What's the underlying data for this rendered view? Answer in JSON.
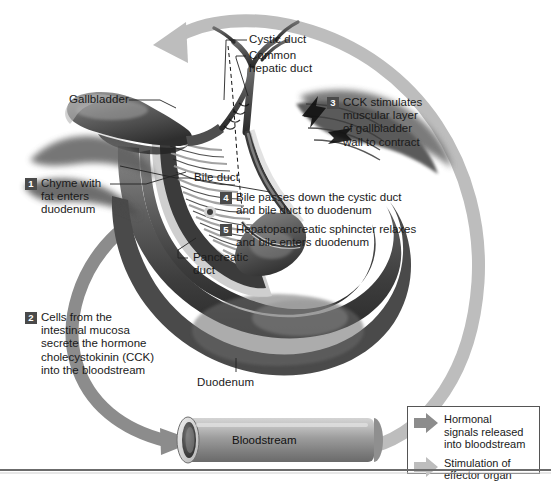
{
  "figure": {
    "background": "#ffffff",
    "width": 551,
    "height": 486
  },
  "colors": {
    "hormonal_arrow": "#8c8c8c",
    "stimulation_arrow": "#bdbdbd",
    "badge_background": "#4a4a4a",
    "badge_text": "#ffffff",
    "label_text": "#1a1a1a",
    "leader_line": "#222222",
    "legend_border": "#555555",
    "rule": "#6b6b6b"
  },
  "steps": [
    {
      "number": "1",
      "text": "Chyme with\nfat enters\nduodenum"
    },
    {
      "number": "2",
      "text": "Cells from the\nintestinal mucosa\nsecrete the hormone\ncholecystokinin (CCK)\ninto the bloodstream"
    },
    {
      "number": "3",
      "text": "CCK stimulates\nmuscular layer\nof gallbladder\nwall to contract"
    },
    {
      "number": "4",
      "text": "Bile passes down the cystic duct\nand bile duct to duodenum"
    },
    {
      "number": "5",
      "text": "Hepatopancreatic sphincter relaxes\nand bile enters duodenum"
    }
  ],
  "anatomy_labels": [
    {
      "name": "cystic-duct",
      "text": "Cystic duct"
    },
    {
      "name": "common-hepatic-duct",
      "text": "Common\nhepatic duct"
    },
    {
      "name": "gallbladder",
      "text": "Gallbladder"
    },
    {
      "name": "bile-duct",
      "text": "Bile duct"
    },
    {
      "name": "pancreatic-duct",
      "text": "Pancreatic\nduct"
    },
    {
      "name": "duodenum",
      "text": "Duodenum"
    }
  ],
  "bloodstream": {
    "label": "Bloodstream"
  },
  "legend": {
    "items": [
      {
        "arrow": "hormonal",
        "text": "Hormonal\nsignals released\ninto bloodstream"
      },
      {
        "arrow": "stimulation",
        "text": "Stimulation of\neffector organ"
      }
    ]
  }
}
